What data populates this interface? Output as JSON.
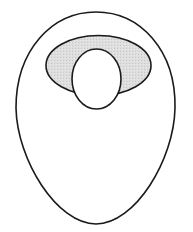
{
  "diagram": {
    "title": "",
    "shapes": [
      {
        "id": "outer-egg",
        "kind": "egg-outline",
        "fill": "#ffffff",
        "stroke": "#1a1a1a"
      },
      {
        "id": "shaded-ellipse",
        "kind": "ellipse",
        "fill": "#dedede",
        "stroke": "#1a1a1a"
      },
      {
        "id": "inner-oval",
        "kind": "ellipse",
        "fill": "#ffffff",
        "stroke": "#1a1a1a"
      }
    ],
    "colors": {
      "stroke": "#1a1a1a",
      "shade": "#dedede",
      "background": "#ffffff"
    }
  }
}
